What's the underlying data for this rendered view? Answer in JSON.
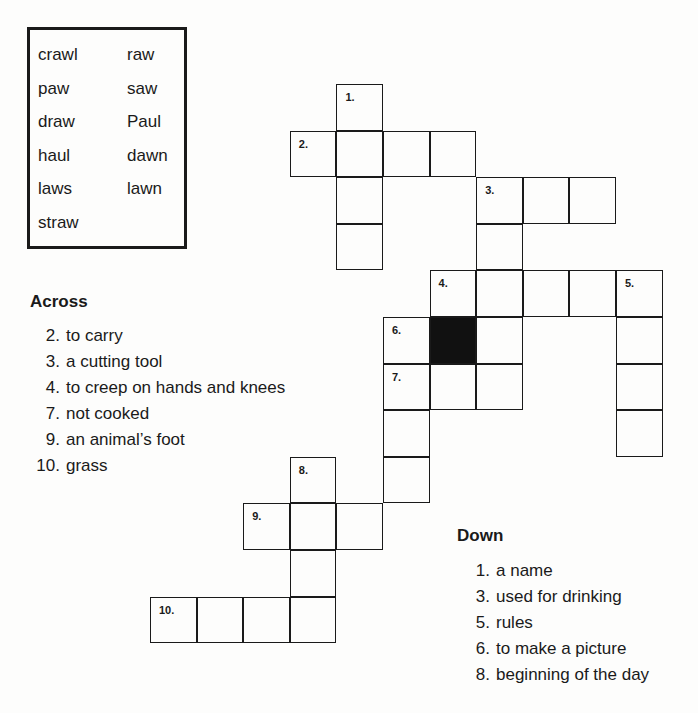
{
  "word_bank": {
    "left_column": [
      "crawl",
      "paw",
      "draw",
      "haul",
      "laws",
      "straw"
    ],
    "right_column": [
      "raw",
      "saw",
      "Paul",
      "dawn",
      "lawn"
    ]
  },
  "grid": {
    "origin_x": 150,
    "origin_y": 84,
    "cell_size": 46.6,
    "cells": [
      {
        "col": 4,
        "row": 0,
        "number": "1."
      },
      {
        "col": 3,
        "row": 1,
        "number": "2."
      },
      {
        "col": 4,
        "row": 1
      },
      {
        "col": 5,
        "row": 1
      },
      {
        "col": 6,
        "row": 1
      },
      {
        "col": 4,
        "row": 2
      },
      {
        "col": 4,
        "row": 3
      },
      {
        "col": 7,
        "row": 2,
        "number": "3."
      },
      {
        "col": 8,
        "row": 2
      },
      {
        "col": 9,
        "row": 2
      },
      {
        "col": 7,
        "row": 3
      },
      {
        "col": 6,
        "row": 4,
        "number": "4."
      },
      {
        "col": 7,
        "row": 4
      },
      {
        "col": 8,
        "row": 4
      },
      {
        "col": 9,
        "row": 4
      },
      {
        "col": 10,
        "row": 4,
        "number": "5."
      },
      {
        "col": 5,
        "row": 5,
        "number": "6."
      },
      {
        "col": 6,
        "row": 5,
        "black": true
      },
      {
        "col": 7,
        "row": 5
      },
      {
        "col": 10,
        "row": 5
      },
      {
        "col": 5,
        "row": 6,
        "number": "7."
      },
      {
        "col": 6,
        "row": 6
      },
      {
        "col": 7,
        "row": 6
      },
      {
        "col": 10,
        "row": 6
      },
      {
        "col": 10,
        "row": 7
      },
      {
        "col": 5,
        "row": 7
      },
      {
        "col": 5,
        "row": 8
      },
      {
        "col": 3,
        "row": 8,
        "number": "8."
      },
      {
        "col": 2,
        "row": 9,
        "number": "9."
      },
      {
        "col": 3,
        "row": 9
      },
      {
        "col": 4,
        "row": 9
      },
      {
        "col": 3,
        "row": 10
      },
      {
        "col": 0,
        "row": 11,
        "number": "10."
      },
      {
        "col": 1,
        "row": 11
      },
      {
        "col": 2,
        "row": 11
      },
      {
        "col": 3,
        "row": 11
      }
    ]
  },
  "across": {
    "heading": "Across",
    "clues": [
      {
        "number": "2.",
        "text": "to carry"
      },
      {
        "number": "3.",
        "text": "a cutting tool"
      },
      {
        "number": "4.",
        "text": "to creep on hands and knees"
      },
      {
        "number": "7.",
        "text": "not cooked"
      },
      {
        "number": "9.",
        "text": "an animal’s foot"
      },
      {
        "number": "10.",
        "text": "grass"
      }
    ]
  },
  "down": {
    "heading": "Down",
    "clues": [
      {
        "number": "1.",
        "text": "a name"
      },
      {
        "number": "3.",
        "text": "used for drinking"
      },
      {
        "number": "5.",
        "text": "rules"
      },
      {
        "number": "6.",
        "text": "to make a picture"
      },
      {
        "number": "8.",
        "text": "beginning of the day"
      }
    ]
  }
}
